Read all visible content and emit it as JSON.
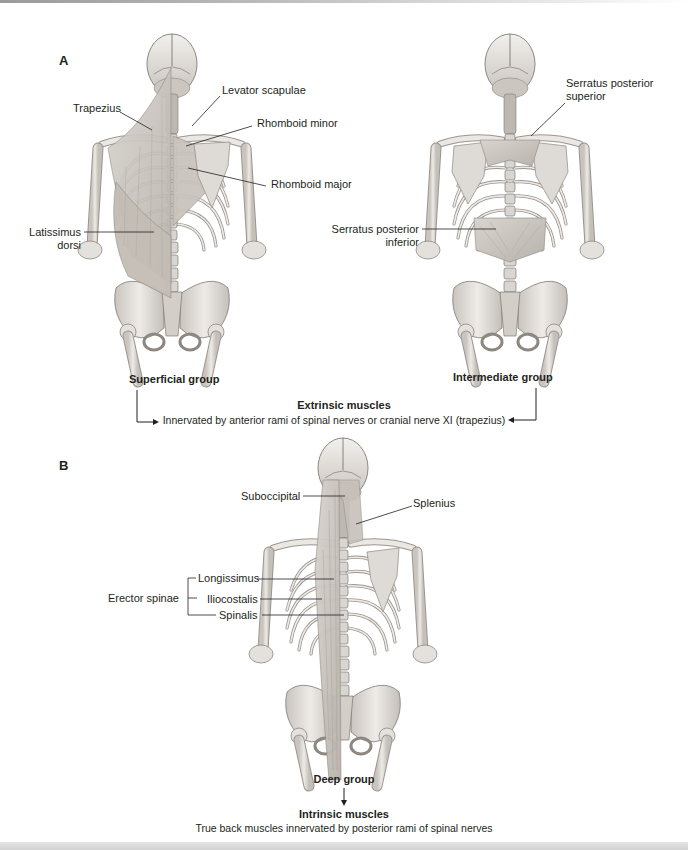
{
  "figure": {
    "panel_a": {
      "letter": "A",
      "superficial": {
        "caption": "Superficial group",
        "labels": {
          "trapezius": "Trapezius",
          "levator_scapulae": "Levator scapulae",
          "rhomboid_minor": "Rhomboid minor",
          "rhomboid_major": "Rhomboid major",
          "latissimus_line1": "Latissimus",
          "latissimus_line2": "dorsi"
        }
      },
      "intermediate": {
        "caption": "Intermediate group",
        "labels": {
          "serratus_sup_line1": "Serratus posterior",
          "serratus_sup_line2": "superior",
          "serratus_inf_line1": "Serratus posterior",
          "serratus_inf_line2": "inferior"
        }
      },
      "extrinsic": {
        "title": "Extrinsic muscles",
        "description": "Innervated by anterior rami of spinal nerves or cranial nerve XI (trapezius)"
      }
    },
    "panel_b": {
      "letter": "B",
      "deep": {
        "caption": "Deep group",
        "labels": {
          "suboccipital": "Suboccipital",
          "splenius": "Splenius",
          "erector_spinae": "Erector spinae",
          "longissimus": "Longissimus",
          "iliocostalis": "Iliocostalis",
          "spinalis": "Spinalis"
        }
      },
      "intrinsic": {
        "title": "Intrinsic muscles",
        "description": "True back muscles innervated by posterior rami of spinal nerves"
      }
    },
    "colors": {
      "bone": "#e9e6e2",
      "bone_shadow": "#b9b4ae",
      "muscle": "#cfcac4",
      "line": "#231f20"
    }
  }
}
